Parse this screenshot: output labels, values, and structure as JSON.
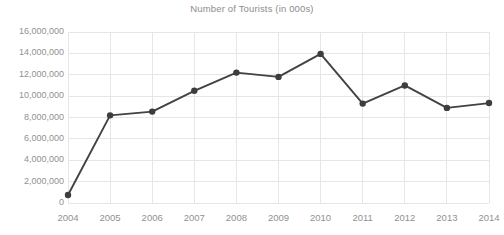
{
  "chart_data": {
    "type": "line",
    "title": "Number of Tourists (in 000s)",
    "xlabel": "",
    "ylabel": "",
    "categories": [
      "2004",
      "2005",
      "2006",
      "2007",
      "2008",
      "2009",
      "2010",
      "2011",
      "2012",
      "2013",
      "2014"
    ],
    "values": [
      750000,
      8200000,
      8550000,
      10500000,
      12200000,
      11800000,
      13950000,
      9300000,
      11000000,
      8900000,
      9350000
    ],
    "series": [
      {
        "name": "Number of Tourists",
        "values": [
          750000,
          8200000,
          8550000,
          10500000,
          12200000,
          11800000,
          13950000,
          9300000,
          11000000,
          8900000,
          9350000
        ]
      }
    ],
    "ylim": [
      0,
      16000000
    ],
    "ytick_values": [
      0,
      2000000,
      4000000,
      6000000,
      8000000,
      10000000,
      12000000,
      14000000,
      16000000
    ],
    "ytick_labels": [
      "0",
      "2,000,000",
      "4,000,000",
      "6,000,000",
      "8,000,000",
      "10,000,000",
      "12,000,000",
      "14,000,000",
      "16,000,000"
    ],
    "xtick_labels": [
      "2004",
      "2005",
      "2006",
      "2007",
      "2008",
      "2009",
      "2010",
      "2011",
      "2012",
      "2013",
      "2014"
    ],
    "grid": {
      "horizontal": true,
      "vertical": true
    },
    "legend": {
      "visible": false,
      "position": "none"
    },
    "colors": {
      "line": "#424242",
      "marker": "#3d3d3d",
      "gridline": "#e6e6e6",
      "tick_label": "#919191",
      "title": "#8c8c8c",
      "background": "#ffffff"
    },
    "marker": {
      "shape": "circle",
      "radius": 3.2
    },
    "line_width": 1.9
  }
}
